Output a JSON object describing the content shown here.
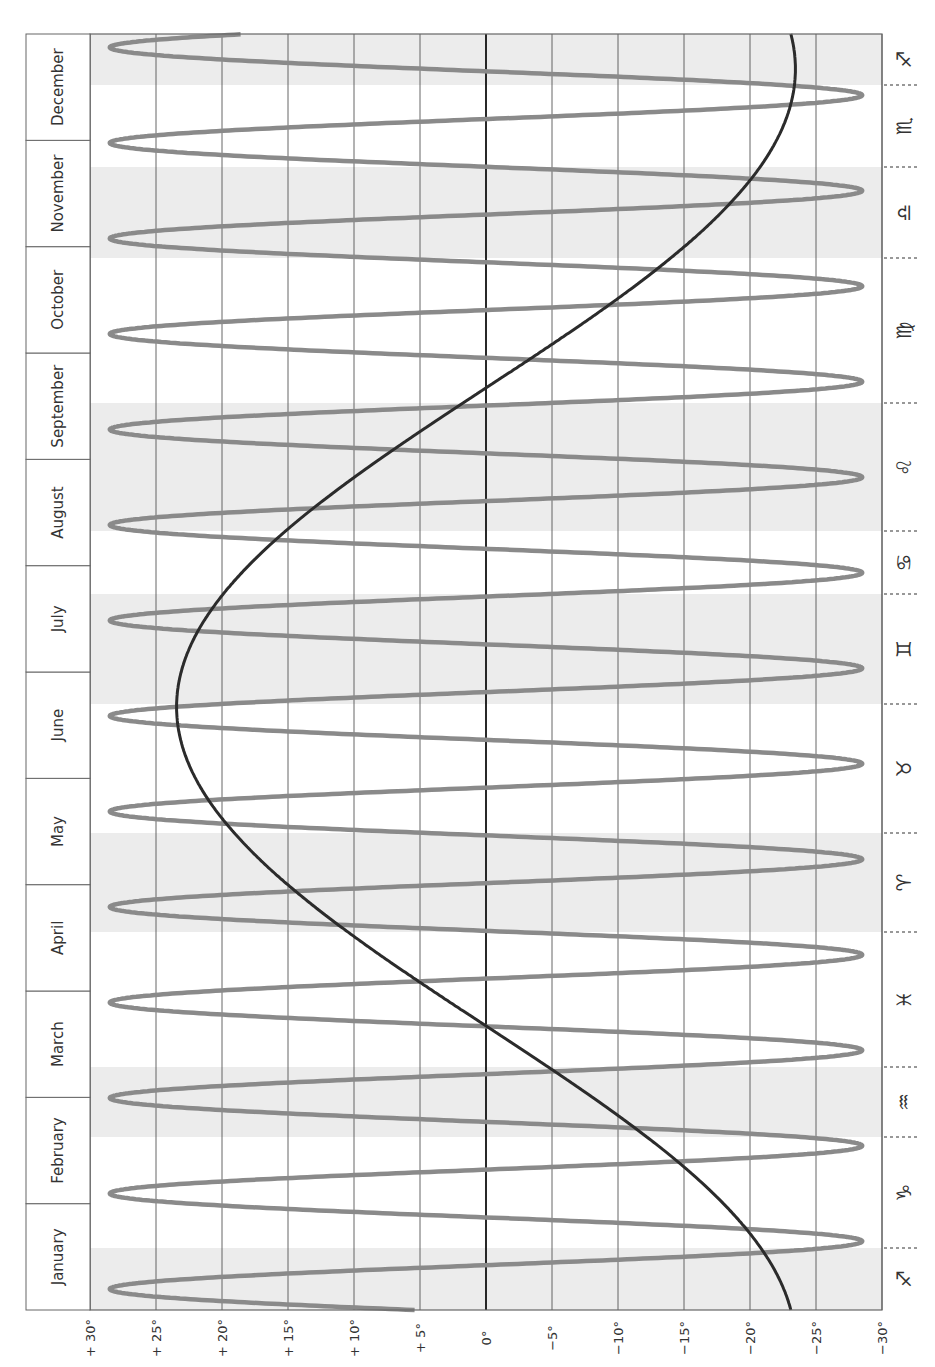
{
  "chart_data": {
    "type": "line",
    "title": "",
    "orientation": "rotated: declination on horizontal axis (bottom), time (months) on vertical axis running bottom (January) to top (December)",
    "xlabel": "Declination",
    "ylabel": "Month",
    "xlim": [
      30,
      -30
    ],
    "x_ticks": [
      30,
      25,
      20,
      15,
      10,
      5,
      0,
      -5,
      -10,
      -15,
      -20,
      -25,
      -30
    ],
    "x_tick_labels": [
      "+ 30°",
      "+ 25°",
      "+ 20°",
      "+ 15°",
      "+ 10°",
      "+ 5°",
      "0°",
      "−5°",
      "−10°",
      "−15°",
      "−20°",
      "−25°",
      "−30°"
    ],
    "grid": true,
    "months": [
      "January",
      "February",
      "March",
      "April",
      "May",
      "June",
      "July",
      "August",
      "September",
      "October",
      "November",
      "December"
    ],
    "zodiac_bands": [
      {
        "sign": "Sagittarius",
        "glyph": "♐",
        "shaded": true
      },
      {
        "sign": "Capricorn",
        "glyph": "♑",
        "shaded": false
      },
      {
        "sign": "Aquarius",
        "glyph": "♒",
        "shaded": true
      },
      {
        "sign": "Pisces",
        "glyph": "♓",
        "shaded": false
      },
      {
        "sign": "Aries",
        "glyph": "♈",
        "shaded": true
      },
      {
        "sign": "Taurus",
        "glyph": "♉",
        "shaded": false
      },
      {
        "sign": "Gemini",
        "glyph": "♊",
        "shaded": true
      },
      {
        "sign": "Cancer",
        "glyph": "♋",
        "shaded": false
      },
      {
        "sign": "Leo",
        "glyph": "♌",
        "shaded": true
      },
      {
        "sign": "Virgo",
        "glyph": "♍",
        "shaded": false
      },
      {
        "sign": "Libra",
        "glyph": "♎",
        "shaded": true
      },
      {
        "sign": "Scorpio",
        "glyph": "♏",
        "shaded": false
      },
      {
        "sign": "Sagittarius",
        "glyph": "♐",
        "shaded": true
      }
    ],
    "zodiac_band_bounds_px": [
      1310,
      1248,
      1137,
      1067,
      932,
      833,
      704,
      594,
      531,
      403,
      258,
      167,
      85,
      34
    ],
    "series": [
      {
        "name": "Sun declination",
        "color": "#2b2b2b",
        "model": "sinusoid",
        "amplitude_deg": 23.44,
        "min_day": 355,
        "points": [
          {
            "date": "Jan 1",
            "dec": -23.0
          },
          {
            "date": "Feb 1",
            "dec": -17.2
          },
          {
            "date": "Mar 1",
            "dec": -7.8
          },
          {
            "date": "Mar 20",
            "dec": 0.0
          },
          {
            "date": "Apr 1",
            "dec": 4.3
          },
          {
            "date": "May 1",
            "dec": 15.0
          },
          {
            "date": "Jun 1",
            "dec": 22.0
          },
          {
            "date": "Jun 21",
            "dec": 23.4
          },
          {
            "date": "Jul 1",
            "dec": 23.1
          },
          {
            "date": "Aug 1",
            "dec": 18.0
          },
          {
            "date": "Sep 1",
            "dec": 8.4
          },
          {
            "date": "Sep 23",
            "dec": 0.0
          },
          {
            "date": "Oct 1",
            "dec": -3.0
          },
          {
            "date": "Nov 1",
            "dec": -14.3
          },
          {
            "date": "Dec 1",
            "dec": -21.8
          },
          {
            "date": "Dec 21",
            "dec": -23.4
          },
          {
            "date": "Dec 31",
            "dec": -23.1
          }
        ]
      },
      {
        "name": "Moon declination",
        "color": "#8a8a8a",
        "model": "sinusoid",
        "amplitude_deg": 28.5,
        "period_days": 27.32,
        "first_max_day": 6,
        "cycles_in_year": 13.4
      }
    ]
  },
  "layout": {
    "plot": {
      "left": 90,
      "right": 882,
      "top": 34,
      "bottom": 1310
    },
    "month_column": {
      "left": 26,
      "right": 90
    },
    "zodiac_column": {
      "left": 882,
      "right": 935
    },
    "colors": {
      "shade": "#ececec",
      "grid": "#555555",
      "zero_line": "#111111",
      "frame": "#666666",
      "sun": "#2b2b2b",
      "moon": "#8a8a8a"
    }
  }
}
